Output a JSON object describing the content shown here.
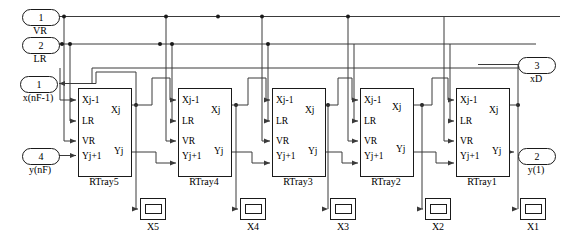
{
  "diagram": {
    "line_color": "#3a3a3a",
    "block_border_color": "#1a1a1a",
    "background": "#ffffff"
  },
  "ports": {
    "inputs": [
      {
        "num": "1",
        "label": "VR",
        "x": 22,
        "y": 9,
        "w": 36,
        "label_x": 22,
        "label_y": 25
      },
      {
        "num": "2",
        "label": "LR",
        "x": 22,
        "y": 37,
        "w": 36,
        "label_x": 22,
        "label_y": 53
      },
      {
        "num": "4",
        "label": "y(nF)",
        "x": 22,
        "y": 148,
        "w": 36,
        "label_x": 14,
        "label_y": 164
      }
    ],
    "outputs": [
      {
        "num": "1",
        "label": "x(nF-1)",
        "x": 20,
        "y": 76,
        "w": 36,
        "label_x": 8,
        "label_y": 92
      },
      {
        "num": "3",
        "label": "xD",
        "x": 518,
        "y": 57,
        "w": 36,
        "label_x": 518,
        "label_y": 73
      },
      {
        "num": "2",
        "label": "y(1)",
        "x": 518,
        "y": 148,
        "w": 36,
        "label_x": 516,
        "label_y": 164
      }
    ]
  },
  "blocks": [
    {
      "name": "RTray5",
      "x": 78,
      "y": 88,
      "w": 52,
      "h": 87,
      "inputs": [
        "Xj-1",
        "LR",
        "VR",
        "Yj+1"
      ],
      "outputs": [
        "Xj",
        "Yj"
      ]
    },
    {
      "name": "RTray4",
      "x": 178,
      "y": 88,
      "w": 52,
      "h": 87,
      "inputs": [
        "Xj-1",
        "LR",
        "VR",
        "Yj+1"
      ],
      "outputs": [
        "Xj",
        "Yj"
      ]
    },
    {
      "name": "RTray3",
      "x": 272,
      "y": 88,
      "w": 52,
      "h": 87,
      "inputs": [
        "Xj-1",
        "LR",
        "VR",
        "Yj+1"
      ],
      "outputs": [
        "Xj",
        "Yj"
      ]
    },
    {
      "name": "RTray2",
      "x": 360,
      "y": 88,
      "w": 52,
      "h": 87,
      "inputs": [
        "Xj-1",
        "LR",
        "VR",
        "Yj+1"
      ],
      "outputs": [
        "Xj",
        "Yj"
      ]
    },
    {
      "name": "RTray1",
      "x": 456,
      "y": 88,
      "w": 52,
      "h": 87,
      "inputs": [
        "Xj-1",
        "LR",
        "VR",
        "Yj+1"
      ],
      "outputs": [
        "Xj",
        "Yj"
      ]
    }
  ],
  "scopes": [
    {
      "label": "X5",
      "x": 140,
      "y": 198
    },
    {
      "label": "X4",
      "x": 240,
      "y": 198
    },
    {
      "label": "X3",
      "x": 330,
      "y": 198
    },
    {
      "label": "X2",
      "x": 425,
      "y": 198
    },
    {
      "label": "X1",
      "x": 520,
      "y": 198
    }
  ]
}
